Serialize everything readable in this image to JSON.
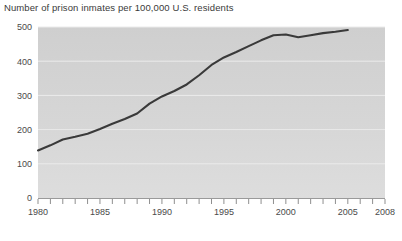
{
  "chart_data": {
    "type": "line",
    "title": "Number of prison inmates per 100,000 U.S. residents",
    "xlabel": "",
    "ylabel": "",
    "xlim": [
      1980,
      2008
    ],
    "ylim": [
      0,
      500
    ],
    "yticks": [
      0,
      100,
      200,
      300,
      400,
      500
    ],
    "ytick_labels": [
      "0",
      "100",
      "200",
      "300",
      "400",
      "500"
    ],
    "xticks": [
      1980,
      1985,
      1990,
      1995,
      2000,
      2005,
      2008
    ],
    "xtick_labels": [
      "1980",
      "1985",
      "1990",
      "1995",
      "2000",
      "2005",
      "2008"
    ],
    "x_minor_tick_step": 1,
    "grid": "horizontal",
    "legend": "none",
    "line_color": "#3a3a3a",
    "plot_background": "#d4d4d4",
    "x": [
      1980,
      1981,
      1982,
      1983,
      1984,
      1985,
      1986,
      1987,
      1988,
      1989,
      1990,
      1991,
      1992,
      1993,
      1994,
      1995,
      1996,
      1997,
      1998,
      1999,
      2000,
      2001,
      2002,
      2003,
      2004,
      2005
    ],
    "values": [
      139,
      154,
      171,
      179,
      188,
      202,
      217,
      231,
      247,
      276,
      297,
      313,
      332,
      359,
      389,
      411,
      427,
      444,
      461,
      476,
      478,
      470,
      476,
      482,
      486,
      491
    ],
    "series": [
      {
        "name": "Prison inmates per 100,000 residents",
        "values": [
          139,
          154,
          171,
          179,
          188,
          202,
          217,
          231,
          247,
          276,
          297,
          313,
          332,
          359,
          389,
          411,
          427,
          444,
          461,
          476,
          478,
          470,
          476,
          482,
          486,
          491
        ]
      }
    ]
  }
}
